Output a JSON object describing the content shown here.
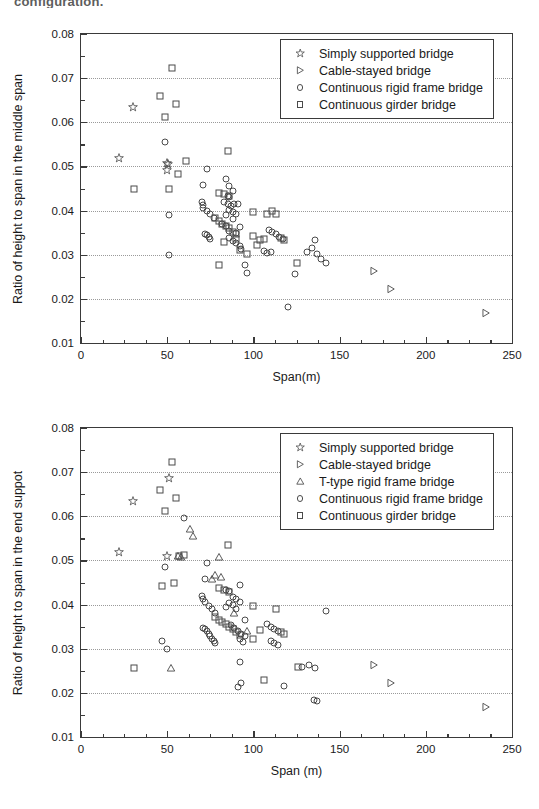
{
  "caption_fragment": "configuration.",
  "charts": [
    {
      "id": "middle-span",
      "type": "scatter",
      "title": "",
      "xlabel": "Span(m)",
      "ylabel": "Ratio of height to span in the middle span",
      "xlim": [
        0,
        250
      ],
      "ylim": [
        0.01,
        0.08
      ],
      "xticks": [
        0,
        50,
        100,
        150,
        200,
        250
      ],
      "yticks": [
        0.01,
        0.02,
        0.03,
        0.04,
        0.05,
        0.06,
        0.07,
        0.08
      ],
      "xminor_step": 12.5,
      "yminor_step": 0.005,
      "grid": "horizontal-dotted",
      "legend_position": "top-right",
      "series": [
        {
          "name": "Simply supported bridge",
          "marker": "star",
          "points": [
            [
              22,
              0.0519
            ],
            [
              30,
              0.0634
            ],
            [
              50,
              0.0508
            ],
            [
              50.5,
              0.0505
            ],
            [
              50,
              0.0492
            ]
          ]
        },
        {
          "name": "Cable-stayed bridge",
          "marker": "triangle-right",
          "points": [
            [
              170,
              0.0263
            ],
            [
              180,
              0.0222
            ],
            [
              235,
              0.0168
            ]
          ]
        },
        {
          "name": "Continuous rigid frame bridge",
          "marker": "circle",
          "points": [
            [
              49,
              0.0555
            ],
            [
              51,
              0.0389
            ],
            [
              51,
              0.03
            ],
            [
              73,
              0.0494
            ],
            [
              71,
              0.0459
            ],
            [
              70,
              0.0419
            ],
            [
              70.5,
              0.0412
            ],
            [
              71,
              0.0405
            ],
            [
              73,
              0.0399
            ],
            [
              75,
              0.0393
            ],
            [
              77,
              0.0384
            ],
            [
              72,
              0.0348
            ],
            [
              73,
              0.0345
            ],
            [
              74,
              0.034
            ],
            [
              75,
              0.0336
            ],
            [
              84,
              0.0471
            ],
            [
              86,
              0.0455
            ],
            [
              88,
              0.0445
            ],
            [
              85,
              0.0434
            ],
            [
              86,
              0.043
            ],
            [
              83,
              0.0419
            ],
            [
              85,
              0.0414
            ],
            [
              87,
              0.041
            ],
            [
              89,
              0.0414
            ],
            [
              91,
              0.0416
            ],
            [
              86,
              0.0401
            ],
            [
              88,
              0.0396
            ],
            [
              90,
              0.0392
            ],
            [
              84,
              0.0389
            ],
            [
              88,
              0.0382
            ],
            [
              82,
              0.0369
            ],
            [
              84,
              0.0364
            ],
            [
              92,
              0.0362
            ],
            [
              86,
              0.0354
            ],
            [
              90,
              0.0349
            ],
            [
              86,
              0.0338
            ],
            [
              88,
              0.0332
            ],
            [
              90,
              0.0326
            ],
            [
              92,
              0.0319
            ],
            [
              93,
              0.0313
            ],
            [
              95,
              0.0277
            ],
            [
              96,
              0.0259
            ],
            [
              109,
              0.0357
            ],
            [
              111,
              0.0352
            ],
            [
              113,
              0.0347
            ],
            [
              115,
              0.0341
            ],
            [
              117,
              0.0336
            ],
            [
              106,
              0.0309
            ],
            [
              108,
              0.0305
            ],
            [
              110,
              0.0306
            ],
            [
              124,
              0.0256
            ],
            [
              120,
              0.0182
            ],
            [
              131,
              0.0307
            ],
            [
              134,
              0.0315
            ],
            [
              136,
              0.0333
            ],
            [
              137,
              0.0301
            ],
            [
              139,
              0.0291
            ],
            [
              142,
              0.0281
            ]
          ]
        },
        {
          "name": "Continuous girder bridge",
          "marker": "square",
          "points": [
            [
              53,
              0.0722
            ],
            [
              46,
              0.0659
            ],
            [
              55,
              0.0642
            ],
            [
              49,
              0.0611
            ],
            [
              31,
              0.0448
            ],
            [
              51,
              0.0448
            ],
            [
              85,
              0.0536
            ],
            [
              61,
              0.0512
            ],
            [
              56,
              0.0482
            ],
            [
              80,
              0.044
            ],
            [
              83,
              0.0437
            ],
            [
              86,
              0.0432
            ],
            [
              100,
              0.0396
            ],
            [
              111,
              0.0398
            ],
            [
              113,
              0.0392
            ],
            [
              108,
              0.0393
            ],
            [
              78,
              0.0383
            ],
            [
              80,
              0.0376
            ],
            [
              82,
              0.037
            ],
            [
              84,
              0.0366
            ],
            [
              86,
              0.036
            ],
            [
              100,
              0.0342
            ],
            [
              88,
              0.0352
            ],
            [
              90,
              0.0347
            ],
            [
              83,
              0.0329
            ],
            [
              102,
              0.0322
            ],
            [
              90,
              0.0336
            ],
            [
              104,
              0.0334
            ],
            [
              106,
              0.0335
            ],
            [
              118,
              0.0334
            ],
            [
              116,
              0.0337
            ],
            [
              80,
              0.0277
            ],
            [
              125,
              0.0281
            ],
            [
              96,
              0.0302
            ],
            [
              92,
              0.031
            ]
          ]
        }
      ]
    },
    {
      "id": "end-support",
      "type": "scatter",
      "title": "",
      "xlabel": "Span (m)",
      "ylabel": "Ratio of height to span in the end suppot",
      "xlim": [
        0,
        250
      ],
      "ylim": [
        0.01,
        0.08
      ],
      "xticks": [
        0,
        50,
        100,
        150,
        200,
        250
      ],
      "yticks": [
        0.01,
        0.02,
        0.03,
        0.04,
        0.05,
        0.06,
        0.07,
        0.08
      ],
      "xminor_step": 12.5,
      "yminor_step": 0.005,
      "grid": "horizontal-dotted",
      "legend_position": "top-right",
      "series": [
        {
          "name": "Simply supported bridge",
          "marker": "star",
          "points": [
            [
              22,
              0.0519
            ],
            [
              30,
              0.0634
            ],
            [
              51,
              0.0686
            ],
            [
              50,
              0.051
            ]
          ]
        },
        {
          "name": "Cable-stayed bridge",
          "marker": "triangle-right",
          "points": [
            [
              170,
              0.0263
            ],
            [
              180,
              0.0222
            ],
            [
              235,
              0.0168
            ]
          ]
        },
        {
          "name": "T-type rigid frame bridge",
          "marker": "triangle-up",
          "points": [
            [
              63,
              0.0572
            ],
            [
              65,
              0.0556
            ],
            [
              56,
              0.0509
            ],
            [
              58,
              0.0508
            ],
            [
              80,
              0.0508
            ],
            [
              78,
              0.0466
            ],
            [
              81,
              0.0463
            ],
            [
              76,
              0.0459
            ],
            [
              89,
              0.0382
            ],
            [
              52,
              0.0256
            ],
            [
              96,
              0.0339
            ]
          ]
        },
        {
          "name": "Continuous rigid frame bridge",
          "marker": "circle",
          "points": [
            [
              60,
              0.0597
            ],
            [
              49,
              0.0484
            ],
            [
              47,
              0.0318
            ],
            [
              50,
              0.0299
            ],
            [
              73,
              0.0494
            ],
            [
              72,
              0.0459
            ],
            [
              70,
              0.0419
            ],
            [
              71,
              0.0412
            ],
            [
              72,
              0.0405
            ],
            [
              74,
              0.0397
            ],
            [
              76,
              0.039
            ],
            [
              78,
              0.0381
            ],
            [
              71,
              0.0348
            ],
            [
              72,
              0.0344
            ],
            [
              73,
              0.0339
            ],
            [
              74,
              0.0334
            ],
            [
              75,
              0.0329
            ],
            [
              76,
              0.0323
            ],
            [
              77,
              0.0318
            ],
            [
              78,
              0.0313
            ],
            [
              84,
              0.0434
            ],
            [
              86,
              0.043
            ],
            [
              92,
              0.0444
            ],
            [
              88,
              0.0418
            ],
            [
              90,
              0.0412
            ],
            [
              86,
              0.0404
            ],
            [
              88,
              0.0398
            ],
            [
              84,
              0.0394
            ],
            [
              90,
              0.0389
            ],
            [
              92,
              0.0406
            ],
            [
              95,
              0.0364
            ],
            [
              87,
              0.0353
            ],
            [
              89,
              0.0347
            ],
            [
              91,
              0.034
            ],
            [
              93,
              0.0334
            ],
            [
              95,
              0.0329
            ],
            [
              92,
              0.0322
            ],
            [
              94,
              0.0316
            ],
            [
              108,
              0.0355
            ],
            [
              110,
              0.0349
            ],
            [
              112,
              0.0344
            ],
            [
              114,
              0.0339
            ],
            [
              110,
              0.0318
            ],
            [
              112,
              0.0313
            ],
            [
              114,
              0.0308
            ],
            [
              142,
              0.0386
            ],
            [
              92,
              0.0271
            ],
            [
              128,
              0.0259
            ],
            [
              132,
              0.0262
            ],
            [
              136,
              0.0257
            ],
            [
              93,
              0.0223
            ],
            [
              91,
              0.0214
            ],
            [
              118,
              0.0216
            ],
            [
              135,
              0.0184
            ],
            [
              137,
              0.0182
            ]
          ]
        },
        {
          "name": "Continuous girder bridge",
          "marker": "square",
          "points": [
            [
              53,
              0.0722
            ],
            [
              46,
              0.0659
            ],
            [
              55,
              0.0642
            ],
            [
              49,
              0.0611
            ],
            [
              85,
              0.0536
            ],
            [
              60,
              0.0512
            ],
            [
              57,
              0.051
            ],
            [
              47,
              0.0441
            ],
            [
              54,
              0.0448
            ],
            [
              80,
              0.0437
            ],
            [
              83,
              0.0433
            ],
            [
              86,
              0.0428
            ],
            [
              100,
              0.0396
            ],
            [
              113,
              0.0391
            ],
            [
              78,
              0.0372
            ],
            [
              80,
              0.0366
            ],
            [
              82,
              0.0361
            ],
            [
              84,
              0.0355
            ],
            [
              86,
              0.035
            ],
            [
              88,
              0.0345
            ],
            [
              104,
              0.0342
            ],
            [
              90,
              0.0338
            ],
            [
              92,
              0.0332
            ],
            [
              100,
              0.0322
            ],
            [
              118,
              0.0334
            ],
            [
              116,
              0.0337
            ],
            [
              31,
              0.0256
            ],
            [
              126,
              0.0258
            ],
            [
              106,
              0.0228
            ]
          ]
        }
      ]
    }
  ]
}
